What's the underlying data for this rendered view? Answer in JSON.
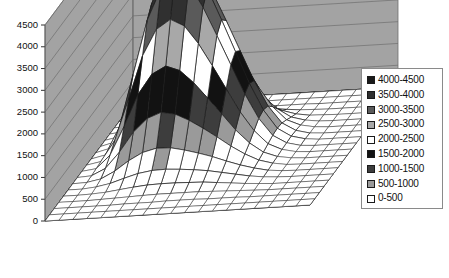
{
  "chart_data": {
    "type": "surface3d",
    "title": "",
    "xlabel": "",
    "ylabel": "",
    "zlabel": "",
    "zlim": [
      0,
      4500
    ],
    "z_tick_labels": [
      "4500",
      "4000",
      "3500",
      "3000",
      "2500",
      "2000",
      "1500",
      "1000",
      "500",
      "0"
    ],
    "z_ticks": [
      4500,
      4000,
      3500,
      3000,
      2500,
      2000,
      1500,
      1000,
      500,
      0
    ],
    "band_interval": 500,
    "grid": true,
    "legend_position": "right",
    "legend_entries": [
      {
        "label": "4000-4500",
        "color": "#1a1a1a",
        "min": 4000,
        "max": 4500
      },
      {
        "label": "3500-4000",
        "color": "#303030",
        "min": 3500,
        "max": 4000
      },
      {
        "label": "3000-3500",
        "color": "#5a5a5a",
        "min": 3000,
        "max": 3500
      },
      {
        "label": "2500-3000",
        "color": "#a8a8a8",
        "min": 2500,
        "max": 3000
      },
      {
        "label": "2000-2500",
        "color": "#ffffff",
        "min": 2000,
        "max": 2500
      },
      {
        "label": "1500-2000",
        "color": "#121212",
        "min": 1500,
        "max": 2000
      },
      {
        "label": "1000-1500",
        "color": "#3d3d3d",
        "min": 1000,
        "max": 1500
      },
      {
        "label": "500-1000",
        "color": "#9a9a9a",
        "min": 500,
        "max": 1000
      },
      {
        "label": "0-500",
        "color": "#ffffff",
        "min": 0,
        "max": 500
      }
    ],
    "wall_color": "#a3a3a3",
    "wall_line_color": "#6e6e6e",
    "floor_color": "#ffffff",
    "mesh_line_color": "#1c1c1c",
    "x_categories": [
      "1",
      "2",
      "3",
      "4",
      "5",
      "6",
      "7",
      "8",
      "9",
      "10",
      "11",
      "12",
      "13",
      "14",
      "15",
      "16",
      "17",
      "18",
      "19",
      "20"
    ],
    "y_categories": [
      "1",
      "2",
      "3",
      "4",
      "5",
      "6",
      "7",
      "8",
      "9",
      "10",
      "11",
      "12",
      "13",
      "14",
      "15",
      "16",
      "17",
      "18",
      "19",
      "20"
    ],
    "z_values": [
      [
        0,
        0,
        0,
        0,
        0,
        0,
        0,
        0,
        0,
        0,
        0,
        0,
        0,
        0,
        0,
        0,
        0,
        0,
        0,
        0
      ],
      [
        0,
        0,
        0,
        0,
        0,
        0,
        0,
        0,
        0,
        0,
        0,
        0,
        0,
        0,
        0,
        0,
        0,
        0,
        0,
        0
      ],
      [
        0,
        0,
        10,
        20,
        20,
        20,
        30,
        30,
        20,
        20,
        20,
        10,
        10,
        10,
        0,
        0,
        0,
        0,
        0,
        0
      ],
      [
        0,
        10,
        40,
        120,
        200,
        260,
        300,
        280,
        220,
        180,
        140,
        90,
        50,
        20,
        10,
        0,
        0,
        0,
        0,
        0
      ],
      [
        0,
        20,
        120,
        420,
        760,
        980,
        1080,
        1020,
        860,
        700,
        520,
        330,
        170,
        70,
        20,
        10,
        0,
        0,
        0,
        0
      ],
      [
        0,
        40,
        300,
        900,
        1600,
        2050,
        2200,
        2080,
        1780,
        1420,
        1040,
        660,
        350,
        140,
        50,
        10,
        0,
        0,
        0,
        0
      ],
      [
        0,
        60,
        520,
        1450,
        2450,
        3050,
        3250,
        3080,
        2650,
        2120,
        1560,
        1000,
        540,
        220,
        80,
        20,
        0,
        0,
        0,
        0
      ],
      [
        0,
        80,
        700,
        1900,
        3150,
        3900,
        4180,
        3950,
        3400,
        2720,
        2010,
        1300,
        700,
        290,
        100,
        20,
        0,
        0,
        0,
        0
      ],
      [
        0,
        80,
        760,
        2050,
        3350,
        4150,
        4450,
        4200,
        3600,
        2880,
        2130,
        1380,
        750,
        310,
        110,
        30,
        0,
        0,
        0,
        0
      ],
      [
        0,
        70,
        680,
        1880,
        3100,
        3820,
        4100,
        3880,
        3330,
        2660,
        1970,
        1280,
        700,
        290,
        100,
        20,
        0,
        0,
        0,
        0
      ],
      [
        0,
        60,
        520,
        1450,
        2430,
        3020,
        3230,
        3060,
        2640,
        2110,
        1560,
        1010,
        560,
        240,
        90,
        20,
        0,
        0,
        0,
        0
      ],
      [
        0,
        40,
        330,
        960,
        1680,
        2130,
        2300,
        2180,
        1880,
        1510,
        1130,
        740,
        420,
        190,
        70,
        20,
        0,
        0,
        0,
        0
      ],
      [
        0,
        20,
        170,
        520,
        960,
        1260,
        1380,
        1320,
        1160,
        960,
        740,
        510,
        310,
        150,
        60,
        10,
        0,
        0,
        0,
        0
      ],
      [
        0,
        10,
        70,
        230,
        450,
        620,
        700,
        690,
        620,
        530,
        430,
        310,
        200,
        110,
        40,
        10,
        0,
        0,
        0,
        0
      ],
      [
        0,
        0,
        30,
        90,
        190,
        280,
        330,
        340,
        320,
        290,
        250,
        190,
        130,
        70,
        30,
        10,
        0,
        0,
        0,
        0
      ],
      [
        0,
        0,
        10,
        30,
        70,
        110,
        140,
        150,
        150,
        140,
        130,
        100,
        70,
        40,
        20,
        0,
        0,
        0,
        0,
        0
      ],
      [
        0,
        0,
        0,
        10,
        20,
        30,
        40,
        50,
        50,
        50,
        50,
        40,
        30,
        20,
        10,
        0,
        0,
        0,
        0,
        0
      ],
      [
        0,
        0,
        0,
        0,
        0,
        10,
        10,
        10,
        20,
        20,
        20,
        10,
        10,
        10,
        0,
        0,
        0,
        0,
        0,
        0
      ],
      [
        0,
        0,
        0,
        0,
        0,
        0,
        0,
        0,
        0,
        0,
        0,
        0,
        0,
        0,
        0,
        0,
        0,
        0,
        0,
        0
      ],
      [
        0,
        0,
        0,
        0,
        0,
        0,
        0,
        0,
        0,
        0,
        0,
        0,
        0,
        0,
        0,
        0,
        0,
        0,
        0,
        0
      ]
    ]
  },
  "axis": {
    "ticks": [
      "4500",
      "4000",
      "3500",
      "3000",
      "2500",
      "2000",
      "1500",
      "1000",
      "500",
      "0"
    ]
  },
  "legend": {
    "items": [
      {
        "label": "4000-4500"
      },
      {
        "label": "3500-4000"
      },
      {
        "label": "3000-3500"
      },
      {
        "label": "2500-3000"
      },
      {
        "label": "2000-2500"
      },
      {
        "label": "1500-2000"
      },
      {
        "label": "1000-1500"
      },
      {
        "label": "500-1000"
      },
      {
        "label": "0-500"
      }
    ]
  }
}
